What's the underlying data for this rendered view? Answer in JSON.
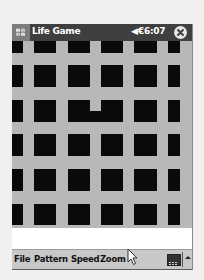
{
  "titlebar": {
    "app_title": "Life Game",
    "volume_icon": "◀€",
    "time": "6:07",
    "start_icon": "windows-flag-icon",
    "close_icon": "close-circle-icon"
  },
  "grid": {
    "cell_color": "#0a0a0a",
    "background_color": "#b8b8b8",
    "columns_x": [
      [
        0,
        11
      ],
      [
        22,
        44
      ],
      [
        56,
        78
      ],
      [
        89,
        111
      ],
      [
        122,
        145
      ],
      [
        156,
        168
      ]
    ],
    "rows_y": [
      [
        0,
        12
      ],
      [
        24,
        46
      ],
      [
        59,
        81
      ],
      [
        93,
        115
      ],
      [
        128,
        150
      ],
      [
        163,
        184
      ]
    ],
    "bridges": [
      {
        "x": 78,
        "y": 70,
        "w": 11,
        "h": 11
      }
    ]
  },
  "menubar": {
    "items": [
      {
        "label": "File",
        "x": 2
      },
      {
        "label": "Pattern",
        "x": 22
      },
      {
        "label": "Speed",
        "x": 59
      },
      {
        "label": "Zoom",
        "x": 88
      }
    ],
    "keyboard_icon": "keyboard-icon",
    "sip_arrow_icon": "sip-up-arrow-icon"
  }
}
